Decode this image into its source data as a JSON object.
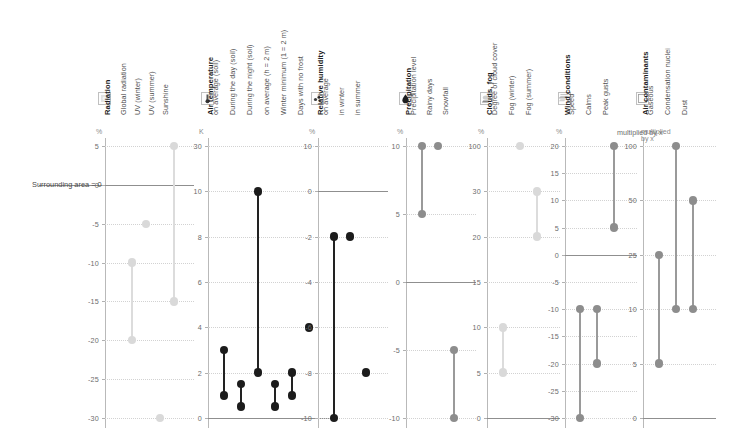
{
  "figure": {
    "baseline_label": "Surrounding area = 0",
    "multiplied_label": "multiplied by x",
    "width": 737,
    "height": 442
  },
  "chart_data": {
    "type": "scatter",
    "title": "",
    "xlabel": "",
    "ylabel": "",
    "grid": true,
    "legend": "none",
    "baseline": 0,
    "baseline_label": "Surrounding area = 0",
    "note": "Range plot: each series shows either a single value or a low-high range relative to the surrounding area (=0).",
    "groups": [
      {
        "name": "Radiation",
        "icon": "sun-icon",
        "unit": "%",
        "ticks": [
          5,
          0,
          -5,
          -10,
          -15,
          -20,
          -25,
          -30
        ],
        "ylim": [
          -32,
          7
        ],
        "tone": "light",
        "series": [
          {
            "label": "Global radiation",
            "low": -20,
            "high": -10
          },
          {
            "label": "UV (winter)",
            "value": -5
          },
          {
            "label": "UV (summer)",
            "value": -30
          },
          {
            "label": "Sunshine",
            "low": -15,
            "high": 5
          }
        ]
      },
      {
        "name": "Air temperature",
        "icon": "thermometer-icon",
        "unit": "K",
        "ticks": [
          30,
          10,
          8,
          6,
          4,
          2,
          0
        ],
        "ylim": [
          0,
          30
        ],
        "tone": "dark",
        "series": [
          {
            "label": "on average (soil)",
            "low": 1,
            "high": 3
          },
          {
            "label": "During the day (soil)",
            "low": 0.5,
            "high": 1.5
          },
          {
            "label": "During the night (soil)",
            "low": 2,
            "high": 10
          },
          {
            "label": "on average (h = 2 m)",
            "low": 0.5,
            "high": 1.5
          },
          {
            "label": "Winter minimum (1 = 2 m)",
            "low": 1,
            "high": 2
          },
          {
            "label": "Days with no frost",
            "value": 4
          }
        ]
      },
      {
        "name": "Relative humidity",
        "icon": "droplets-icon",
        "unit": "%",
        "ticks": [
          10,
          0,
          -2,
          -4,
          -6,
          -8,
          -10
        ],
        "ylim": [
          -10,
          10
        ],
        "tone": "dark",
        "series": [
          {
            "label": "on average",
            "low": -10,
            "high": -2
          },
          {
            "label": "in winter",
            "value": -2
          },
          {
            "label": "in summer",
            "value": -8
          }
        ]
      },
      {
        "name": "Precipitation",
        "icon": "raindrop-icon",
        "unit": "%",
        "ticks": [
          10,
          5,
          0,
          -5,
          -10
        ],
        "ylim": [
          -10,
          10
        ],
        "tone": "mid",
        "series": [
          {
            "label": "Precipitation level",
            "low": 5,
            "high": 10
          },
          {
            "label": "Rainy days",
            "value": 10
          },
          {
            "label": "Snowfall",
            "low": -10,
            "high": -5
          }
        ]
      },
      {
        "name": "Clouds, fog",
        "icon": "cloud-icon",
        "unit": "%",
        "ticks": [
          100,
          30,
          20,
          15,
          10,
          5,
          0
        ],
        "ylim": [
          0,
          100
        ],
        "tone": "light",
        "series": [
          {
            "label": "Degree of cloud cover",
            "low": 5,
            "high": 10
          },
          {
            "label": "Fog (winter)",
            "value": 100
          },
          {
            "label": "Fog (summer)",
            "low": 20,
            "high": 30
          }
        ]
      },
      {
        "name": "Wind conditions",
        "icon": "wind-icon",
        "unit": "%",
        "ticks": [
          20,
          15,
          10,
          5,
          0,
          -5,
          -10,
          -15,
          -20,
          -25,
          -30
        ],
        "ylim": [
          -30,
          20
        ],
        "tone": "mid",
        "series": [
          {
            "label": "Speed",
            "low": -30,
            "high": -10
          },
          {
            "label": "Calms",
            "low": -20,
            "high": -10
          },
          {
            "label": "Peak gusts",
            "low": 5,
            "high": 20
          }
        ]
      },
      {
        "name": "Air contaminants",
        "icon": "blank-box-icon",
        "unit": "multiplied by x",
        "ticks": [
          100,
          50,
          25,
          10,
          5,
          0
        ],
        "ylim": [
          0,
          100
        ],
        "tone": "mid",
        "series": [
          {
            "label": "Gaseous",
            "low": 5,
            "high": 25
          },
          {
            "label": "Condensation nuclei",
            "low": 10,
            "high": 100
          },
          {
            "label": "Dust",
            "low": 10,
            "high": 50
          }
        ]
      }
    ]
  }
}
